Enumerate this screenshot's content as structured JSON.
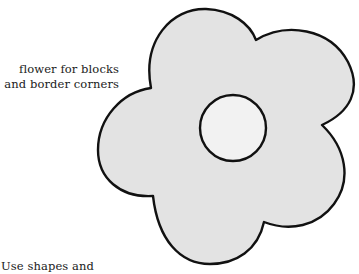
{
  "captions": {
    "top_line1": "flower for blocks",
    "top_line2": "and border corners",
    "bottom_partial": "Use shapes and"
  },
  "flower": {
    "petals": 5,
    "fill_color": "#e3e3e3",
    "center_fill_color": "#f2f2f2",
    "outline_color": "#111111"
  }
}
